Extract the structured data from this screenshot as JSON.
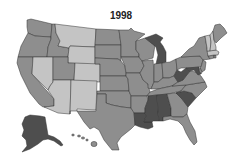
{
  "title": "1998",
  "legend_colors": {
    "light": "#c4c4c4",
    "medium": "#8e8e8e",
    "dark": "#4e4e4e"
  },
  "states": {
    "WA": "medium",
    "OR": "medium",
    "CA": "medium",
    "ID": "medium",
    "NV": "light",
    "MT": "light",
    "WY": "light",
    "UT": "medium",
    "AZ": "light",
    "CO": "light",
    "NM": "light",
    "ND": "medium",
    "SD": "medium",
    "NE": "medium",
    "KS": "medium",
    "OK": "medium",
    "TX": "medium",
    "MN": "medium",
    "IA": "medium",
    "MO": "medium",
    "AR": "medium",
    "LA": "dark",
    "WI": "medium",
    "IL": "medium",
    "MI": "dark",
    "IN": "medium",
    "OH": "medium",
    "KY": "medium",
    "TN": "medium",
    "MS": "dark",
    "AL": "dark",
    "GA": "medium",
    "FL": "medium",
    "SC": "dark",
    "NC": "medium",
    "VA": "medium",
    "WV": "dark",
    "PA": "medium",
    "NY": "medium",
    "ME": "medium",
    "VT": "light",
    "NH": "light",
    "MA": "light",
    "CT": "medium",
    "RI": "medium",
    "NJ": "medium",
    "DE": "medium",
    "MD": "dark",
    "AK": "dark",
    "HI": "medium"
  }
}
